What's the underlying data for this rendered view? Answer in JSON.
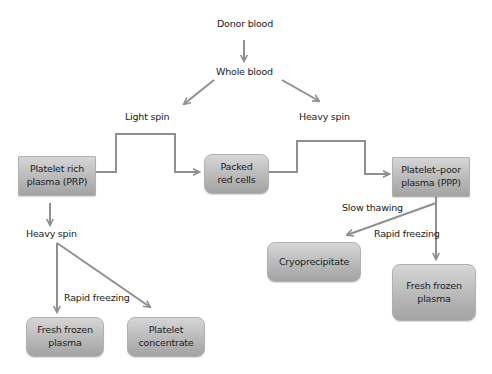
{
  "diagram": {
    "colors": {
      "arrow": "#8f8f8f",
      "box_top": "#d6d6d6",
      "box_bottom": "#a3a3a3",
      "text": "#1a1a1a"
    },
    "labels": {
      "donor_blood": "Donor blood",
      "whole_blood": "Whole blood",
      "light_spin": "Light spin",
      "heavy_spin_top": "Heavy spin",
      "heavy_spin_left": "Heavy spin",
      "slow_thawing": "Slow thawing",
      "rapid_freezing_right": "Rapid freezing",
      "rapid_freezing_left": "Rapid freezing"
    },
    "nodes": {
      "prp": {
        "line1": "Platelet rich",
        "line2": "plasma (PRP)"
      },
      "packed_red_cells": {
        "line1": "Packed",
        "line2": "red cells"
      },
      "ppp": {
        "line1": "Platelet–poor",
        "line2": "plasma (PPP)"
      },
      "cryoprecipitate": {
        "line1": "Cryoprecipitate"
      },
      "ffp_right": {
        "line1": "Fresh frozen",
        "line2": "plasma"
      },
      "ffp_left": {
        "line1": "Fresh frozen",
        "line2": "plasma"
      },
      "platelet_concentrate": {
        "line1": "Platelet",
        "line2": "concentrate"
      }
    },
    "edges": [
      {
        "from": "Donor blood",
        "to": "Whole blood"
      },
      {
        "from": "Whole blood",
        "to": "Light spin"
      },
      {
        "from": "Whole blood",
        "to": "Heavy spin"
      },
      {
        "from": "Platelet rich plasma (PRP)",
        "to": "Packed red cells"
      },
      {
        "from": "Packed red cells",
        "to": "Platelet–poor plasma (PPP)"
      },
      {
        "from": "Platelet–poor plasma (PPP)",
        "to": "Cryoprecipitate",
        "label": "Slow thawing"
      },
      {
        "from": "Platelet–poor plasma (PPP)",
        "to": "Fresh frozen plasma",
        "label": "Rapid freezing"
      },
      {
        "from": "Platelet rich plasma (PRP)",
        "to": "Heavy spin"
      },
      {
        "from": "Heavy spin",
        "to": "Fresh frozen plasma",
        "label": "Rapid freezing"
      },
      {
        "from": "Heavy spin",
        "to": "Platelet concentrate"
      }
    ]
  }
}
